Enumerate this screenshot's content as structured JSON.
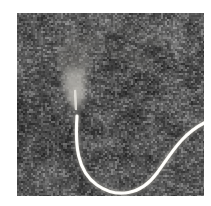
{
  "figure": {
    "kind": "grayscale-ultrasound-scan",
    "modality_label": "B-mode ultrasound speckle image",
    "caption": "",
    "page_background": "#ffffff",
    "frame": {
      "x": 17,
      "y": 13,
      "width": 187,
      "height": 183,
      "border_color": "#b8b8b8"
    },
    "tone": {
      "background_mean_gray": "#4e4e4e",
      "background_dark_gray": "#2a2a2a",
      "background_light_gray": "#7c7c7c",
      "speckle_black": "#141414",
      "speckle_white": "#a8a8a8",
      "structure_bright": "#f2f0ea",
      "structure_core": "#ffffff",
      "plume_bright": "#8e8c86",
      "plume_faint": "#6b6965"
    },
    "speckle": {
      "grain_size_px": 2,
      "density": 0.55,
      "seed": 20240517,
      "contrast": 0.62
    },
    "structures": [
      {
        "name": "catheter-wire",
        "label": "bright curvilinear catheter / guidewire",
        "stroke": "#fbf9f4",
        "stroke_width_px": 3.2,
        "halo_stroke": "#8d8b86",
        "halo_width_px": 6.0,
        "path": "M 60 103 C 58 132, 60 158, 80 172 C 100 186, 124 182, 140 160 C 154 141, 164 122, 187 110"
      },
      {
        "name": "tip-shaft",
        "label": "straight bright shaft above curve",
        "stroke": "#efede7",
        "stroke_width_px": 3.0,
        "path": "M 59 92 L 60 105"
      },
      {
        "name": "acoustic-plume",
        "label": "tapering bright plume / jet above wire tip",
        "fill_top": "#85837d",
        "fill_bottom": "#b9b7b1",
        "apex_x": 59,
        "apex_y": 98,
        "top_y": 22,
        "top_half_width": 17,
        "opacity": 0.55
      },
      {
        "name": "diagonal-streak",
        "label": "faint brighter diagonal band upper region",
        "stroke": "#6e6c68",
        "opacity": 0.3
      }
    ]
  }
}
